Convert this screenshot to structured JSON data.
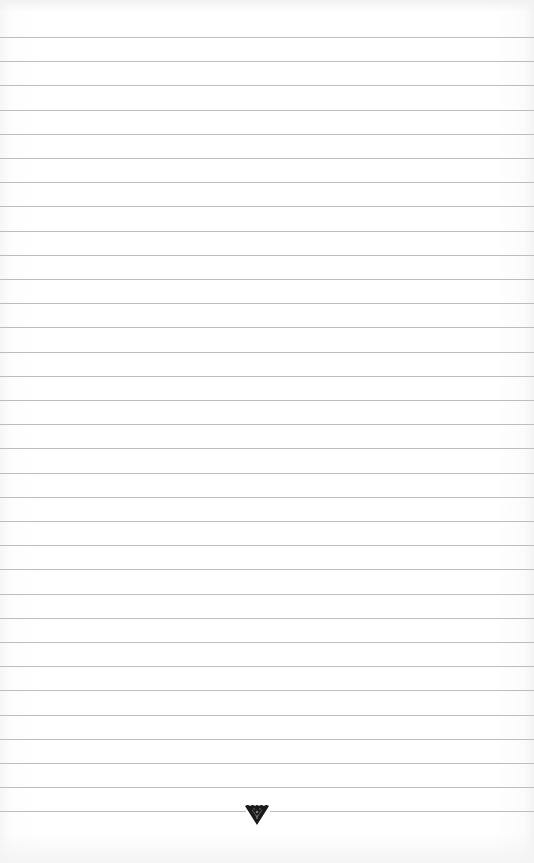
{
  "page": {
    "type": "lined-notebook-page",
    "background_color": "#ffffff",
    "rule_color": "#bdbdbd",
    "rule_count": 33,
    "first_rule_y": 37,
    "rule_spacing": 24.2
  },
  "ornament": {
    "icon": "inverted-triangle-ornament-icon",
    "color": "#1a1a1a",
    "position": "bottom-center"
  }
}
